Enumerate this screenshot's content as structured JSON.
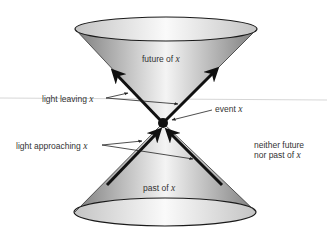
{
  "diagram": {
    "colors": {
      "cone_dark": "#8e8e8e",
      "cone_light": "#f2f2f2",
      "outline": "#1a1a1a",
      "text": "#333333",
      "guide_line": "#d6d6d6"
    },
    "labels": {
      "future": {
        "text": "future of",
        "var": "x"
      },
      "past": {
        "text": "past of",
        "var": "x"
      },
      "light_leaving": {
        "text": "light leaving",
        "var": "x"
      },
      "light_approaching": {
        "text": "light approaching",
        "var": "x"
      },
      "event": {
        "text": "event",
        "var": "x"
      },
      "neither_line1": "neither future",
      "neither_line2": {
        "text": "nor past of",
        "var": "x"
      }
    }
  }
}
